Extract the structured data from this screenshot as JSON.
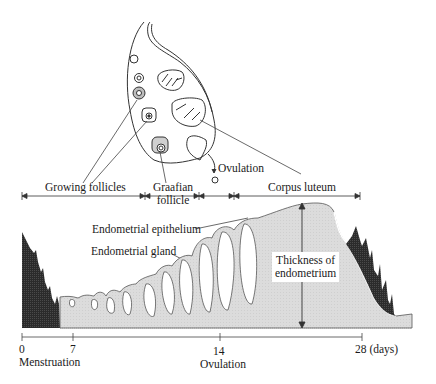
{
  "diagram": {
    "type": "menstrual-cycle-diagram",
    "ovary": {
      "labels": {
        "ovulation": "Ovulation"
      }
    },
    "phases": [
      {
        "id": "growing",
        "label": "Growing follicles",
        "x_start": 22,
        "x_end": 145
      },
      {
        "id": "graafian",
        "label_line1": "Graafian",
        "label_line2": "follicle",
        "x_start": 145,
        "x_end": 199
      },
      {
        "id": "ovulation-gap",
        "x_start": 199,
        "x_end": 234
      },
      {
        "id": "corpus",
        "label": "Corpus luteum",
        "x_start": 234,
        "x_end": 360
      }
    ],
    "endometrium": {
      "epithelium_label": "Endometrial epithelium",
      "gland_label": "Endometrial gland",
      "thickness_label_line1": "Thickness of",
      "thickness_label_line2": "endometrium",
      "fill_color": "#d9d9d9",
      "menstrual_color": "#2a2a2a"
    },
    "timeline": {
      "ticks": [
        {
          "value": "0",
          "x": 22
        },
        {
          "value": "7",
          "x": 73
        },
        {
          "value": "14",
          "x": 220
        },
        {
          "value": "28 (days)",
          "x": 362
        }
      ],
      "labels": {
        "menstruation": "Menstruation",
        "ovulation": "Ovulation"
      }
    }
  }
}
